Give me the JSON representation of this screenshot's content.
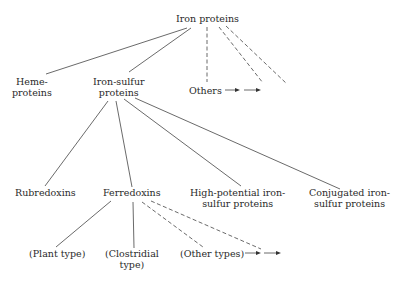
{
  "diagram": {
    "type": "tree",
    "root": {
      "id": "iron-proteins",
      "label": "Iron proteins"
    },
    "nodes": [
      {
        "id": "heme-proteins",
        "line1": "Heme-",
        "line2": "proteins"
      },
      {
        "id": "iron-sulfur-proteins",
        "line1": "Iron-sulfur",
        "line2": "proteins"
      },
      {
        "id": "others",
        "label": "Others"
      },
      {
        "id": "rubredoxins",
        "label": "Rubredoxins"
      },
      {
        "id": "ferredoxins",
        "label": "Ferredoxins"
      },
      {
        "id": "high-potential",
        "line1": "High-potential iron-",
        "line2": "sulfur proteins"
      },
      {
        "id": "conjugated",
        "line1": "Conjugated iron-",
        "line2": "sulfur proteins"
      },
      {
        "id": "plant-type",
        "label": "(Plant type)"
      },
      {
        "id": "clostridial-type",
        "line1": "(Clostridial",
        "line2": "type)"
      },
      {
        "id": "other-types",
        "label": "(Other types)"
      }
    ],
    "edges": [
      {
        "from": "iron-proteins",
        "to": "heme-proteins",
        "style": "solid"
      },
      {
        "from": "iron-proteins",
        "to": "iron-sulfur-proteins",
        "style": "solid"
      },
      {
        "from": "iron-proteins",
        "to": "others",
        "style": "dashed"
      },
      {
        "from": "iron-proteins",
        "to": "unnamed-1",
        "style": "dashed"
      },
      {
        "from": "iron-proteins",
        "to": "unnamed-2",
        "style": "dashed"
      },
      {
        "from": "iron-sulfur-proteins",
        "to": "rubredoxins",
        "style": "solid"
      },
      {
        "from": "iron-sulfur-proteins",
        "to": "ferredoxins",
        "style": "solid"
      },
      {
        "from": "iron-sulfur-proteins",
        "to": "high-potential",
        "style": "solid"
      },
      {
        "from": "iron-sulfur-proteins",
        "to": "conjugated",
        "style": "solid"
      },
      {
        "from": "ferredoxins",
        "to": "plant-type",
        "style": "solid"
      },
      {
        "from": "ferredoxins",
        "to": "clostridial-type",
        "style": "solid"
      },
      {
        "from": "ferredoxins",
        "to": "other-types",
        "style": "dashed"
      },
      {
        "from": "ferredoxins",
        "to": "unnamed-3",
        "style": "dashed"
      }
    ],
    "continuation_arrows": [
      "→ →",
      "→ →"
    ]
  }
}
